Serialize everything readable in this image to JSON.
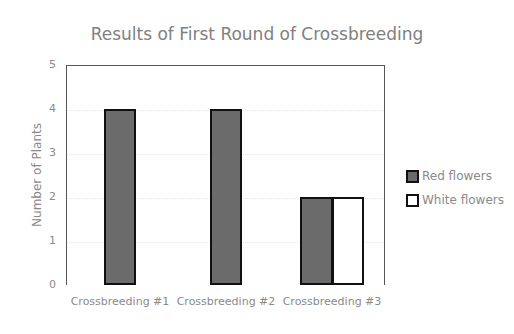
{
  "chart_data": {
    "type": "bar",
    "title": "Results of First Round of Crossbreeding",
    "xlabel": "",
    "ylabel": "Number of Plants",
    "ylim": [
      0,
      5
    ],
    "yticks": [
      "0",
      "1",
      "2",
      "3",
      "4",
      "5"
    ],
    "categories": [
      "Crossbreeding #1",
      "Crossbreeding #2",
      "Crossbreeding #3"
    ],
    "series": [
      {
        "name": "Red flowers",
        "values": [
          4,
          4,
          2
        ],
        "color": "#6b6b6b"
      },
      {
        "name": "White flowers",
        "values": [
          0,
          0,
          2
        ],
        "color": "#ffffff"
      }
    ],
    "legend_position": "right",
    "grid": true
  }
}
